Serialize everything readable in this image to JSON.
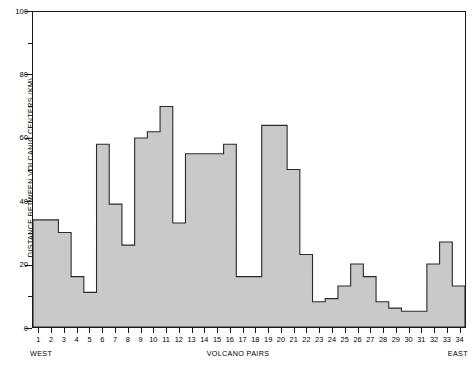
{
  "chart_data": {
    "type": "bar",
    "title": "",
    "xlabel": "VOLCANO PAIRS",
    "ylabel": "DISTANCE BETWEEN VOLCANIC CENTERS (KM)",
    "xlim": [
      0,
      34
    ],
    "ylim": [
      0,
      100
    ],
    "grid": false,
    "legend": null,
    "bar_style": {
      "fill": "#c9c9c9",
      "stroke": "#2b2b2b",
      "stroke_width": 1,
      "gap": 0
    },
    "categories": [
      "1",
      "2",
      "3",
      "4",
      "5",
      "6",
      "7",
      "8",
      "9",
      "10",
      "11",
      "12",
      "13",
      "14",
      "15",
      "16",
      "17",
      "18",
      "19",
      "20",
      "21",
      "22",
      "23",
      "24",
      "25",
      "26",
      "27",
      "28",
      "29",
      "30",
      "31",
      "32",
      "33",
      "34"
    ],
    "values": [
      34,
      34,
      30,
      16,
      11,
      58,
      39,
      26,
      60,
      62,
      70,
      33,
      55,
      55,
      55,
      58,
      16,
      16,
      64,
      64,
      50,
      23,
      8,
      9,
      13,
      20,
      16,
      8,
      6,
      5,
      5,
      20,
      27,
      13
    ],
    "values_right_tail": [
      56,
      56,
      77,
      52,
      94,
      39
    ],
    "y_ticks_major": [
      0,
      20,
      40,
      60,
      80,
      100
    ],
    "y_ticks_minor": [
      10,
      30,
      50,
      70,
      90
    ],
    "x_ticks": [
      "1",
      "2",
      "3",
      "4",
      "5",
      "6",
      "7",
      "8",
      "9",
      "10",
      "11",
      "12",
      "13",
      "14",
      "15",
      "16",
      "17",
      "18",
      "19",
      "20",
      "21",
      "22",
      "23",
      "24",
      "25",
      "26",
      "27",
      "28",
      "29",
      "30",
      "31",
      "32",
      "33",
      "34"
    ],
    "annotations": {
      "west": "WEST",
      "east": "EAST"
    }
  },
  "axis": {
    "y_title": "DISTANCE BETWEEN VOLCANIC CENTERS (KM)",
    "x_title": "VOLCANO PAIRS"
  },
  "labels": {
    "west": "WEST",
    "east": "EAST"
  }
}
